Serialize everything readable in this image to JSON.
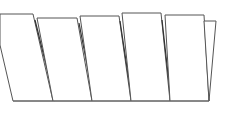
{
  "diagram": {
    "type": "line-drawing",
    "panel_count": 6,
    "stroke_color": "#555555",
    "background": "#ffffff",
    "baseline": {
      "x1": 13,
      "x2": 209,
      "y": 101
    },
    "panels": [
      {
        "id": 1,
        "points": "0,14 33,14 53,101 13,101 0,45",
        "crease": "35,20 55,101"
      },
      {
        "id": 2,
        "points": "37,18 77,18 92,101 53,101",
        "crease": "79,23 94,101"
      },
      {
        "id": 3,
        "points": "80,16 119,16 131,101 92,101",
        "crease": "120,21 132,101"
      },
      {
        "id": 4,
        "points": "122,13 161,13 170,101 131,101",
        "crease": "162,20 171,101"
      },
      {
        "id": 5,
        "points": "165,15 204,15 209,101 170,101",
        "crease": ""
      },
      {
        "id": 6,
        "points": "204,21 216,21 209,101",
        "crease": ""
      }
    ]
  }
}
